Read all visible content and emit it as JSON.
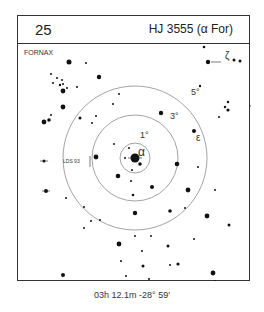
{
  "card": {
    "number": "25",
    "title": "HJ 3555 (α For)",
    "constellation": "FORNAX",
    "coordinates": "03h 12.1m  -28° 59′"
  },
  "chart": {
    "center": [
      117,
      115
    ],
    "circles": [
      {
        "label": "1°",
        "radius": 15,
        "label_pos": [
          122,
          95
        ]
      },
      {
        "label": "3°",
        "radius": 43,
        "label_pos": [
          152,
          76
        ]
      },
      {
        "label": "5°",
        "radius": 72,
        "label_pos": [
          173,
          52
        ]
      }
    ],
    "labels": [
      {
        "text": "α",
        "x": 120,
        "y": 113,
        "size": 12
      },
      {
        "text": "ε",
        "x": 178,
        "y": 98,
        "size": 10
      },
      {
        "text": "ζ",
        "x": 207,
        "y": 16,
        "size": 10
      },
      {
        "text": "LDS 93",
        "x": 45,
        "y": 120,
        "size": 5
      }
    ],
    "stars": [
      [
        51,
        19,
        2.5
      ],
      [
        68,
        20,
        1
      ],
      [
        33,
        31,
        1
      ],
      [
        35,
        40,
        1
      ],
      [
        39,
        35,
        1
      ],
      [
        42,
        42,
        1.2
      ],
      [
        44,
        37,
        1
      ],
      [
        49,
        45,
        1
      ],
      [
        45,
        41,
        1
      ],
      [
        59,
        44,
        1
      ],
      [
        81,
        34,
        2.2
      ],
      [
        101,
        51,
        1
      ],
      [
        95,
        61,
        1
      ],
      [
        45,
        48,
        2.4
      ],
      [
        45,
        64,
        2.4
      ],
      [
        26,
        79,
        2.4
      ],
      [
        31,
        77,
        1.8
      ],
      [
        33,
        72,
        1
      ],
      [
        78,
        73,
        1
      ],
      [
        74,
        80,
        1
      ],
      [
        190,
        19,
        2.2
      ],
      [
        216,
        17,
        1.5
      ],
      [
        222,
        18,
        1.5
      ],
      [
        186,
        4,
        1.3
      ],
      [
        182,
        43,
        1.2
      ],
      [
        210,
        59,
        1.2
      ],
      [
        207,
        64,
        1.2
      ],
      [
        210,
        67,
        1.6
      ],
      [
        234,
        63,
        1.5
      ],
      [
        143,
        70,
        2.2
      ],
      [
        176,
        88,
        2
      ],
      [
        201,
        74,
        1
      ],
      [
        62,
        75,
        1.5
      ],
      [
        26,
        118,
        1.5
      ],
      [
        78,
        114,
        2.4
      ],
      [
        96,
        101,
        1
      ],
      [
        111,
        105,
        1
      ],
      [
        107,
        115,
        1
      ],
      [
        117,
        115,
        4.5
      ],
      [
        122,
        121,
        1.8
      ],
      [
        114,
        127,
        1
      ],
      [
        100,
        133,
        2.3
      ],
      [
        113,
        138,
        1
      ],
      [
        159,
        121,
        2.3
      ],
      [
        180,
        124,
        1
      ],
      [
        115,
        152,
        1.3
      ],
      [
        134,
        144,
        2
      ],
      [
        170,
        147,
        2.4
      ],
      [
        197,
        147,
        1
      ],
      [
        28,
        148,
        2
      ],
      [
        48,
        155,
        1
      ],
      [
        66,
        164,
        1
      ],
      [
        73,
        178,
        1
      ],
      [
        66,
        185,
        1
      ],
      [
        82,
        177,
        1
      ],
      [
        117,
        170,
        2.2
      ],
      [
        152,
        168,
        1.8
      ],
      [
        167,
        165,
        1
      ],
      [
        189,
        173,
        2.4
      ],
      [
        211,
        182,
        1.5
      ],
      [
        101,
        201,
        2.4
      ],
      [
        117,
        193,
        1
      ],
      [
        133,
        193,
        1
      ],
      [
        124,
        208,
        1
      ],
      [
        176,
        196,
        1
      ],
      [
        160,
        221,
        1.6
      ],
      [
        125,
        223,
        1.5
      ],
      [
        152,
        222,
        1
      ],
      [
        195,
        230,
        2.4
      ],
      [
        45,
        232,
        2
      ],
      [
        108,
        233,
        1
      ],
      [
        150,
        203,
        1.5
      ],
      [
        103,
        218,
        1
      ],
      [
        131,
        236,
        1
      ],
      [
        197,
        238,
        1
      ]
    ]
  }
}
